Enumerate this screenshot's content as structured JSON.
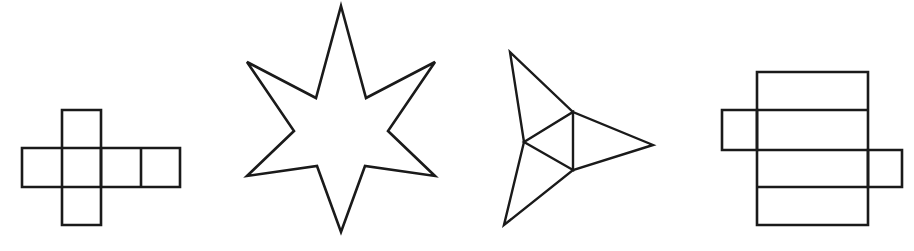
{
  "page": {
    "background_color": "#ffffff",
    "stroke_color": "#1a1a1a",
    "width": 914,
    "height": 251,
    "figure_count": 4
  },
  "figures": [
    {
      "index": 1,
      "name": "cube-net-cross",
      "label": "Cross-shaped cube net",
      "description": "Plus-sign arrangement of squares: a horizontal row of three squares with one square above and one square below the second square, plus an extra square at the right end.",
      "stroke_color": "#1a1a1a",
      "stroke_width": 2.6,
      "bounds": {
        "x": 22,
        "y": 110,
        "width": 158,
        "height": 115
      },
      "geometry": {
        "type": "path-group",
        "paths": [
          "M 22 148 L 180 148 L 180 187 L 22 187 Z",
          "M 62 110 L 101 110 L 101 225 L 62 225 Z",
          "M 101 148 L 101 187",
          "M 141 148 L 141 187"
        ]
      }
    },
    {
      "index": 2,
      "name": "six-pointed-star",
      "label": "Six-pointed star (hexagram)",
      "description": "Two overlapping equilateral triangles forming a six-pointed star with concave curved-looking inner points and a hexagonal centre.",
      "stroke_color": "#1a1a1a",
      "stroke_width": 2.6,
      "bounds": {
        "x": 245,
        "y": 6,
        "width": 192,
        "height": 226
      },
      "geometry": {
        "type": "polygon",
        "points": "341,6 366,98 435,62 388,131 435,176 365,166 341,232 317,166 247,176 294,131 247,62 316,98"
      }
    },
    {
      "index": 3,
      "name": "three-pointed-star",
      "label": "Three-pointed star with inner triangle",
      "description": "A concave three-pointed star (dart/deltoid) whose inner triangle is drawn as a visible outline.",
      "stroke_color": "#1a1a1a",
      "stroke_width": 2.4,
      "bounds": {
        "x": 504,
        "y": 52,
        "width": 149,
        "height": 173
      },
      "geometry": {
        "type": "path-group",
        "paths": [
          "M 510 52 L 573 112 L 653 145 L 573 170 L 504 225 L 524 142 Z",
          "M 524 142 L 573 112 L 573 170 Z"
        ]
      }
    },
    {
      "index": 4,
      "name": "box-net-rectangles",
      "label": "Rectangular box net",
      "description": "A tall stack of four rectangles with a small flap rectangle on the left of the second band and a small flap rectangle on the right of the third band.",
      "stroke_color": "#1a1a1a",
      "stroke_width": 2.6,
      "bounds": {
        "x": 722,
        "y": 72,
        "width": 180,
        "height": 153
      },
      "geometry": {
        "type": "path-group",
        "paths": [
          "M 757 72 L 868 72 L 868 225 L 757 225 Z",
          "M 757 110 L 868 110",
          "M 757 150 L 868 150",
          "M 757 187 L 868 187",
          "M 722 110 L 757 110 L 757 150 L 722 150 Z",
          "M 868 150 L 902 150 L 902 187 L 868 187 Z"
        ]
      }
    }
  ]
}
